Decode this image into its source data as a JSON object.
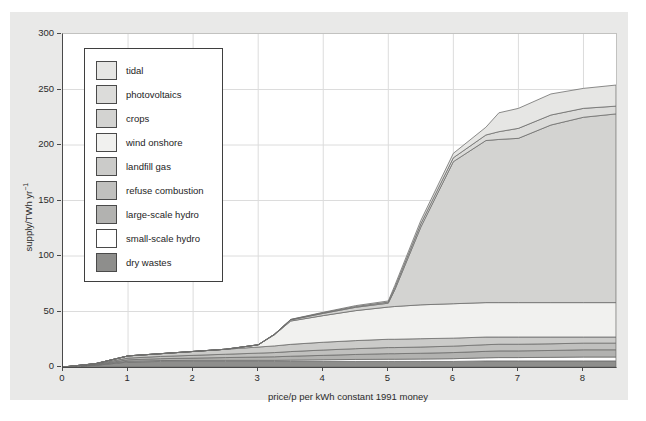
{
  "figure": {
    "panel_background": "#e9e9e8",
    "plot_background": "#ffffff",
    "x_axis": {
      "label": "price/p per kWh constant 1991 money",
      "ticks": [
        0,
        1,
        2,
        3,
        4,
        5,
        6,
        7,
        8
      ]
    },
    "y_axis": {
      "label_main": "supply/TWh yr",
      "label_sup": "−1",
      "ticks": [
        0,
        50,
        100,
        150,
        200,
        250,
        300
      ]
    },
    "legend": {
      "items": [
        {
          "label": "tidal",
          "color": "#e6e6e4"
        },
        {
          "label": "photovoltaics",
          "color": "#dcdcda"
        },
        {
          "label": "crops",
          "color": "#d3d3d1"
        },
        {
          "label": "wind onshore",
          "color": "#f1f1ef"
        },
        {
          "label": "landfill gas",
          "color": "#cbcbc9"
        },
        {
          "label": "refuse combustion",
          "color": "#c0c0be"
        },
        {
          "label": "large-scale hydro",
          "color": "#b2b2b0"
        },
        {
          "label": "small-scale hydro",
          "color": "#ffffff"
        },
        {
          "label": "dry wastes",
          "color": "#8e8e8c"
        }
      ]
    }
  },
  "chart_data": {
    "type": "area",
    "stacked": true,
    "title": "",
    "xlabel": "price/p per kWh constant 1991 money",
    "ylabel": "supply/TWh yr^-1",
    "xlim": [
      0,
      8.5
    ],
    "ylim": [
      0,
      300
    ],
    "grid": true,
    "grid_x": [
      1,
      2,
      3,
      4,
      5,
      6,
      7,
      8
    ],
    "grid_y": [
      50,
      100,
      150,
      200,
      250
    ],
    "grid_color": "#dcdcdc",
    "line_color": "#6f6f6d",
    "legend_position": "upper-left",
    "legend_order_top_to_bottom": [
      "tidal",
      "photovoltaics",
      "crops",
      "wind onshore",
      "landfill gas",
      "refuse combustion",
      "large-scale hydro",
      "small-scale hydro",
      "dry wastes"
    ],
    "x": [
      0,
      0.5,
      1,
      1.5,
      2,
      2.5,
      3,
      3.25,
      3.5,
      4,
      4.5,
      5,
      5.1,
      5.5,
      6,
      6.5,
      6.7,
      7,
      7.5,
      8,
      8.5
    ],
    "series": [
      {
        "name": "dry wastes",
        "color": "#8e8e8c",
        "values": [
          0,
          1.5,
          4.5,
          5,
          5,
          5,
          5,
          5,
          5,
          5,
          5,
          5,
          5,
          5,
          5,
          5.5,
          5.5,
          5.5,
          5.5,
          5.5,
          5.5
        ]
      },
      {
        "name": "small-scale hydro",
        "color": "#ffffff",
        "values": [
          0,
          0.3,
          0.7,
          0.8,
          1,
          1,
          1,
          1,
          1.2,
          1.5,
          1.8,
          2,
          2,
          2.2,
          2.5,
          2.8,
          3,
          3,
          3.2,
          3.5,
          3.5
        ]
      },
      {
        "name": "large-scale hydro",
        "color": "#b2b2b0",
        "values": [
          0,
          0.4,
          1.3,
          1.7,
          2,
          2.5,
          3,
          3.2,
          3.5,
          4,
          4.5,
          5,
          5,
          5.2,
          5.5,
          5.8,
          6,
          6,
          6.2,
          6.5,
          6.5
        ]
      },
      {
        "name": "refuse combustion",
        "color": "#c0c0be",
        "values": [
          0,
          0.4,
          1.5,
          2,
          2.5,
          3,
          3.5,
          3.8,
          4.2,
          4.8,
          5.2,
          5.5,
          5.5,
          5.6,
          5.8,
          6,
          6,
          6,
          6,
          6,
          6
        ]
      },
      {
        "name": "landfill gas",
        "color": "#cbcbc9",
        "values": [
          0,
          0.4,
          2,
          2.5,
          3.5,
          4.5,
          5.5,
          6,
          6.5,
          7,
          7.3,
          7.5,
          7.5,
          7.5,
          7.2,
          6.9,
          6.5,
          6.5,
          6.1,
          5.5,
          5.5
        ]
      },
      {
        "name": "wind onshore",
        "color": "#f1f1ef",
        "values": [
          0,
          0,
          0,
          0,
          0,
          0,
          2,
          10,
          21,
          24,
          27,
          29,
          29.5,
          30.5,
          31,
          31,
          31,
          31,
          31,
          31,
          31
        ]
      },
      {
        "name": "crops",
        "color": "#d3d3d1",
        "values": [
          0,
          0,
          0,
          0,
          0,
          0,
          0,
          0.5,
          1,
          2,
          3,
          3.5,
          15,
          70,
          128,
          146,
          147,
          148,
          160,
          167,
          170
        ]
      },
      {
        "name": "photovoltaics",
        "color": "#dcdcda",
        "values": [
          0,
          0,
          0,
          0,
          0,
          0,
          0,
          0,
          0.3,
          0.5,
          0.7,
          1,
          2,
          3,
          3.5,
          5,
          7,
          9,
          9,
          8,
          7
        ]
      },
      {
        "name": "tidal",
        "color": "#e6e6e4",
        "values": [
          0,
          0,
          0,
          0,
          0,
          0,
          0,
          0,
          0.2,
          0.5,
          0.8,
          1,
          2,
          3,
          4,
          7,
          17,
          18,
          19,
          18,
          19
        ]
      }
    ]
  }
}
